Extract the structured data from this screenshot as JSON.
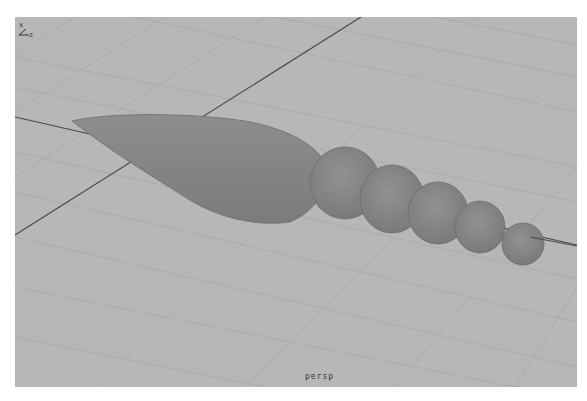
{
  "viewport": {
    "name": "persp",
    "camera_label": "persp",
    "background_color": "#b7b7b7",
    "grid_color": "#a9a9a9",
    "axis_line_color": "#4a4a4a",
    "object_color": "#8a8a8a",
    "object_shadow_color": "#727272"
  },
  "axis_gizmo": {
    "x_label": "x",
    "z_label": "z"
  },
  "scene": {
    "object_name": "carrot-model",
    "segment_count": 5
  }
}
